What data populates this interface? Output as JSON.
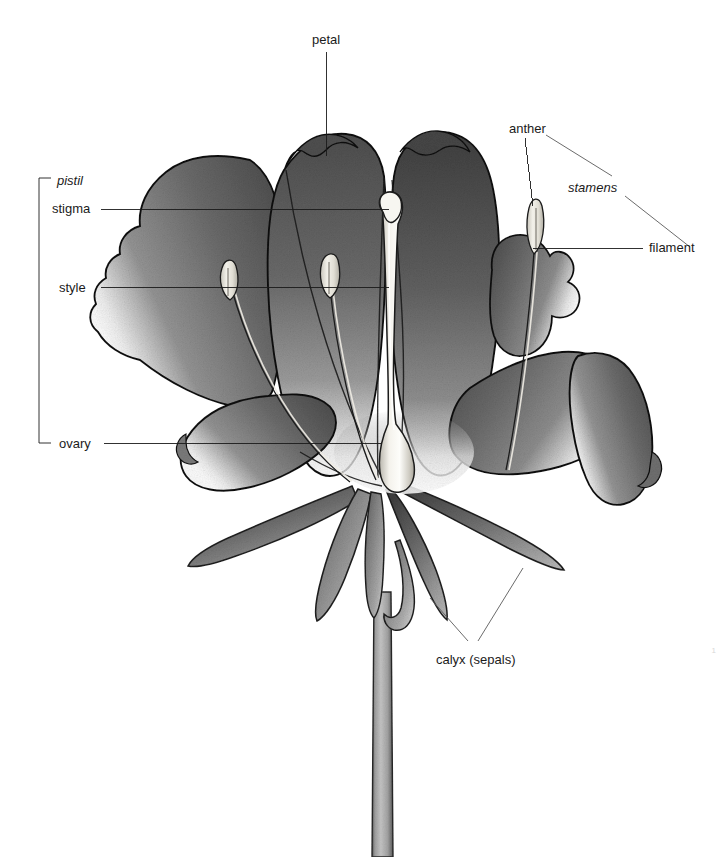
{
  "figure": {
    "kind": "botanical-diagram",
    "background_color": "#ffffff",
    "ink_color": "#1b1b1b",
    "petal_tone": "#6d6d6d",
    "petal_dark_tone": "#4a4a4a",
    "petal_light_tone": "#f2f2f2",
    "sepal_tone": "#8a8a8a",
    "stem_tone": "#a9a9a9",
    "reproductive_tone": "#ece9e0"
  },
  "labels": {
    "petal": "petal",
    "anther": "anther",
    "stamens": "stamens",
    "filament": "filament",
    "pistil": "pistil",
    "stigma": "stigma",
    "style": "style",
    "ovary": "ovary",
    "calyx": "calyx (sepals)"
  },
  "page_number": "1",
  "label_positions": {
    "petal": {
      "x": 312,
      "y": 33
    },
    "anther": {
      "x": 509,
      "y": 122
    },
    "stamens": {
      "x": 568,
      "y": 181
    },
    "filament": {
      "x": 649,
      "y": 244
    },
    "pistil": {
      "x": 57,
      "y": 174
    },
    "stigma": {
      "x": 52,
      "y": 202
    },
    "style": {
      "x": 59,
      "y": 281
    },
    "ovary": {
      "x": 59,
      "y": 437
    },
    "calyx": {
      "x": 436,
      "y": 653
    }
  },
  "leader_lines": [
    {
      "name": "petal-leader",
      "from": [
        326,
        52
      ],
      "to": [
        326,
        156
      ]
    },
    {
      "name": "anther-leader",
      "from": [
        525,
        138
      ],
      "to": [
        533,
        206
      ]
    },
    {
      "name": "stamens-leader-upper",
      "from": [
        546,
        135
      ],
      "to": [
        612,
        176
      ]
    },
    {
      "name": "stamens-leader-lower",
      "from": [
        625,
        196
      ],
      "to": [
        690,
        247
      ]
    },
    {
      "name": "filament-leader",
      "from": [
        643,
        248
      ],
      "to": [
        533,
        248
      ]
    },
    {
      "name": "stigma-leader",
      "from": [
        101,
        209
      ],
      "to": [
        389,
        209
      ]
    },
    {
      "name": "style-leader",
      "from": [
        101,
        287
      ],
      "to": [
        389,
        287
      ]
    },
    {
      "name": "ovary-leader",
      "from": [
        104,
        443
      ],
      "to": [
        381,
        443
      ]
    },
    {
      "name": "calyx-leader-left",
      "from": [
        468,
        641
      ],
      "to": [
        430,
        598
      ]
    },
    {
      "name": "calyx-leader-right",
      "from": [
        478,
        641
      ],
      "to": [
        523,
        568
      ]
    }
  ],
  "bracket": {
    "name": "pistil-bracket",
    "x": 39,
    "top": 178,
    "bottom": 443,
    "tick_length": 12
  },
  "anatomy_parts": [
    {
      "name": "petal",
      "count": 6,
      "description": "broad overlapping corolla lobes, dark gray graded to pale at base"
    },
    {
      "name": "stamen",
      "count": 3,
      "description": "slender filament bearing an elongate pale anther"
    },
    {
      "name": "pistil",
      "count": 1,
      "description": "central column: bulbous stigma, long narrow style, swollen ovary"
    },
    {
      "name": "sepal",
      "count": 5,
      "description": "narrow pointed calyx lobes beneath the corolla"
    },
    {
      "name": "stem",
      "count": 1,
      "description": "straight pale pedicel descending to bottom edge"
    }
  ]
}
